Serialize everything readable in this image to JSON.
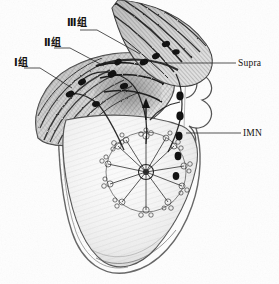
{
  "figure": {
    "kind": "anatomical-illustration",
    "style": "graphite pencil drawing",
    "background_color": "#fefefe",
    "ink_color": "#14110f"
  },
  "labels": {
    "level1": {
      "text": "Ⅰ组",
      "lang": "zh",
      "meaning": "Level I axillary nodes"
    },
    "level2": {
      "text": "Ⅱ组",
      "lang": "zh",
      "meaning": "Level II axillary nodes"
    },
    "level3": {
      "text": "Ⅲ组",
      "lang": "zh",
      "meaning": "Level III axillary nodes"
    },
    "supra": {
      "text": "Supra",
      "lang": "en",
      "meaning": "Supraclavicular nodes"
    },
    "imn": {
      "text": "IMN",
      "lang": "en",
      "meaning": "Internal mammary nodes"
    }
  },
  "leader_lines": [
    {
      "for": "level1",
      "from": [
        40,
        62
      ],
      "to": [
        72,
        86
      ]
    },
    {
      "for": "level2",
      "from": [
        70,
        42
      ],
      "to": [
        104,
        64
      ]
    },
    {
      "for": "level3",
      "from": [
        97,
        23
      ],
      "to": [
        140,
        52
      ]
    },
    {
      "for": "supra",
      "from": [
        236,
        63
      ],
      "to": [
        160,
        63
      ]
    },
    {
      "for": "imn",
      "from": [
        241,
        133
      ],
      "to": [
        183,
        133
      ]
    }
  ],
  "structures": [
    "shoulder and deltoid",
    "pectoralis major",
    "axilla with lymph node chains",
    "clavicle",
    "sternum and costal cartilages",
    "ribs and chest wall",
    "breast with radial mammary lobules",
    "nipple and areola",
    "internal mammary node chain"
  ]
}
